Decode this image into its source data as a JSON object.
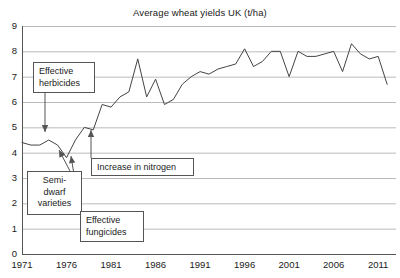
{
  "chart_data": {
    "type": "line",
    "title": "Average wheat yields UK (t/ha)",
    "xlabel": "",
    "ylabel": "",
    "xlim": [
      1971,
      2013
    ],
    "ylim": [
      0,
      9
    ],
    "grid": true,
    "legend": "none",
    "line_color": "#444444",
    "grid_color": "#bbbbbb",
    "axis_color": "#555555",
    "y_ticks": [
      "0",
      "1",
      "2",
      "3",
      "4",
      "5",
      "6",
      "7",
      "8",
      "9"
    ],
    "x_ticks": [
      "1971",
      "1976",
      "1981",
      "1986",
      "1991",
      "1996",
      "2001",
      "2006",
      "2011"
    ],
    "x": [
      1971,
      1972,
      1973,
      1974,
      1975,
      1976,
      1977,
      1978,
      1979,
      1980,
      1981,
      1982,
      1983,
      1984,
      1985,
      1986,
      1987,
      1988,
      1989,
      1990,
      1991,
      1992,
      1993,
      1994,
      1995,
      1996,
      1997,
      1998,
      1999,
      2000,
      2001,
      2002,
      2003,
      2004,
      2005,
      2006,
      2007,
      2008,
      2009,
      2010,
      2011,
      2012
    ],
    "values": [
      4.4,
      4.3,
      4.3,
      4.5,
      4.3,
      3.8,
      4.5,
      5.0,
      4.9,
      5.9,
      5.8,
      6.2,
      6.4,
      7.7,
      6.2,
      6.9,
      5.9,
      6.1,
      6.7,
      7.0,
      7.2,
      7.1,
      7.3,
      7.4,
      7.5,
      8.1,
      7.4,
      7.6,
      8.0,
      8.0,
      7.0,
      8.0,
      7.8,
      7.8,
      7.9,
      8.0,
      7.2,
      8.3,
      7.9,
      7.7,
      7.8,
      6.7
    ],
    "annotations": [
      {
        "id": "effective-herbicides",
        "text": "Effective\nherbicides",
        "align": "left",
        "box": {
          "left": 33,
          "top": 62,
          "width": 62,
          "height": 31
        },
        "arrow": {
          "x1": 45,
          "y1": 93,
          "x2": 45,
          "y2": 132,
          "direction": "down"
        }
      },
      {
        "id": "semi-dwarf-varieties",
        "text": "Semi-\ndwarf\nvarieties",
        "align": "center",
        "box": {
          "left": 27,
          "top": 171,
          "width": 55,
          "height": 44
        },
        "arrow": {
          "x1": 70,
          "y1": 171,
          "x2": 59,
          "y2": 150,
          "direction": "up"
        }
      },
      {
        "id": "increase-in-nitrogen",
        "text": "Increase in nitrogen",
        "align": "left",
        "box": {
          "left": 91,
          "top": 158,
          "width": 103,
          "height": 18
        },
        "arrow": {
          "x1": 91,
          "y1": 158,
          "x2": 91,
          "y2": 130,
          "direction": "up"
        }
      },
      {
        "id": "effective-fungicides",
        "text": "Effective\nfungicides",
        "align": "left",
        "box": {
          "left": 80,
          "top": 211,
          "width": 64,
          "height": 31
        },
        "arrow": {
          "x1": 80,
          "y1": 211,
          "x2": 71,
          "y2": 156,
          "direction": "up"
        }
      }
    ]
  }
}
